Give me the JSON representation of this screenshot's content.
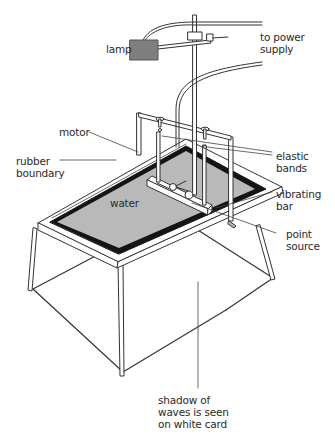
{
  "diagram": {
    "labels": {
      "lamp": "lamp",
      "power": "to power\nsupply",
      "motor": "motor",
      "rubber": "rubber\nboundary",
      "elastic": "elastic\nbands",
      "water": "water",
      "vibrating": "vibrating\nbar",
      "point": "point\nsource",
      "shadow": "shadow of\nwaves is seen\non white card"
    },
    "colors": {
      "water": "#b9b9b9",
      "lamp": "#7f7f7f",
      "rubber": "#141414",
      "line": "#333333",
      "frame": "#ffffff"
    }
  }
}
